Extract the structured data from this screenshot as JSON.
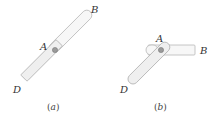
{
  "figures": [
    {
      "id": "a",
      "caption_open": "(",
      "caption_letter": "a",
      "caption_close": ")",
      "labels": {
        "pivot": "A",
        "upper_end": "B",
        "lower_end": "D"
      },
      "description": "Straight rod from D through pivot A to B"
    },
    {
      "id": "b",
      "caption_open": "(",
      "caption_letter": "b",
      "caption_close": ")",
      "labels": {
        "pivot": "A",
        "upper_end": "B",
        "lower_end": "D"
      },
      "description": "Rod D–A inclined, arm A–B rotated to horizontal"
    }
  ],
  "colors": {
    "rod_stroke": "#b8b8b8",
    "rod_fill": "#f7f7f7",
    "pin": "#9a9a9a",
    "text": "#333333"
  }
}
